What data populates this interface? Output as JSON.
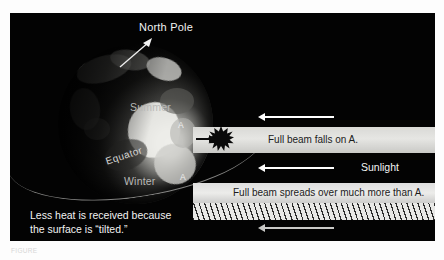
{
  "figure": {
    "panel_background": "#030303",
    "page_background": "#ffffff"
  },
  "globe": {
    "north_pole_label": "North Pole",
    "summer_label": "Summer",
    "winter_label": "Winter",
    "equator_label": "Equator",
    "point_a_upper": "A",
    "point_a_lower": "A"
  },
  "beams": {
    "top_label": "Full beam falls on A.",
    "sunlight_label": "Sunlight",
    "bottom_label": "Full beam spreads over much more than A."
  },
  "caption": {
    "line1": "Less heat is received because",
    "line2": "the surface is “tilted.”"
  },
  "figure_caption": {
    "text": "FIGURE"
  },
  "colors": {
    "beam_light": "#e6e6e3",
    "arrow_white": "#ffffff",
    "arrow_gray": "#c9c9c7",
    "label_gray": "#b9b9b7",
    "text_white": "#f2f2f2",
    "beam_text_dark": "#1b1b1b"
  }
}
